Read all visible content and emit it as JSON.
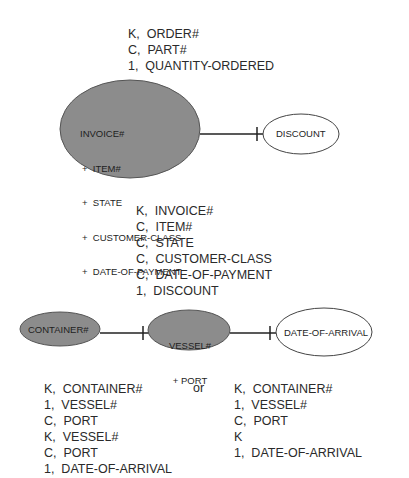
{
  "top_block": {
    "rows": [
      "K,  ORDER#",
      "C,  PART#",
      "1,  QUANTITY-ORDERED"
    ]
  },
  "invoice_entity": {
    "lines": [
      "INVOICE#",
      "+  ITEM#",
      "+  STATE",
      "+  CUSTOMER-CLASS",
      "+  DATE-OF-PAYMENT"
    ],
    "fill": "#8c8c8c"
  },
  "discount_entity": {
    "label": "DISCOUNT",
    "fill": "#ffffff"
  },
  "middle_block": {
    "rows": [
      "K,  INVOICE#",
      "C,  ITEM#",
      "C,  STATE",
      "C,  CUSTOMER-CLASS",
      "C,  DATE-OF-PAYMENT",
      "1,  DISCOUNT"
    ]
  },
  "container_entity": {
    "label": "CONTAINER#",
    "fill": "#8c8c8c"
  },
  "vessel_entity": {
    "lines": [
      "VESSEL#",
      "+ PORT"
    ],
    "fill": "#8c8c8c"
  },
  "date_arrival_entity": {
    "label": "DATE-OF-ARRIVAL",
    "fill": "#ffffff"
  },
  "bottom_left_block": {
    "rows": [
      "K,  CONTAINER#",
      "1,  VESSEL#",
      "C,  PORT",
      "K,  VESSEL#",
      "C,  PORT",
      "1,  DATE-OF-ARRIVAL"
    ]
  },
  "separator": {
    "label": "or"
  },
  "bottom_right_block": {
    "rows": [
      "K,  CONTAINER#",
      "1,  VESSEL#",
      "C,  PORT",
      "K",
      "1,  DATE-OF-ARRIVAL"
    ]
  },
  "colors": {
    "shaded": "#8c8c8c",
    "stroke": "#333333",
    "text": "#2a2a2a"
  }
}
